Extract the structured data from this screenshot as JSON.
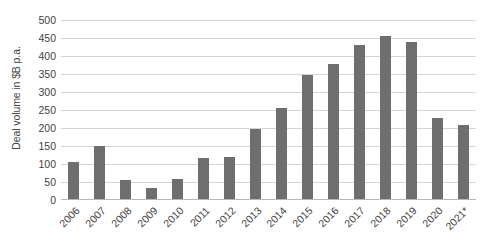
{
  "chart_data": {
    "type": "bar",
    "title": "",
    "subtitle": "",
    "xlabel": "",
    "ylabel": "Deal volume in $B p.a.",
    "ylim": [
      0,
      500
    ],
    "ytick_step": 50,
    "yticks": [
      500,
      450,
      400,
      350,
      300,
      250,
      200,
      150,
      100,
      50,
      0
    ],
    "grid": true,
    "legend": false,
    "legend_position": "none",
    "bar_color": "#6e6e6e",
    "gridline_color": "#d4d4d4",
    "axis_color": "#b8b8b8",
    "categories": [
      "2006",
      "2007",
      "2008",
      "2009",
      "2010",
      "2011",
      "2012",
      "2013",
      "2014",
      "2015",
      "2016",
      "2017",
      "2018",
      "2019",
      "2020",
      "2021*"
    ],
    "values": [
      105,
      150,
      55,
      33,
      58,
      118,
      120,
      197,
      255,
      347,
      378,
      430,
      456,
      440,
      228,
      207
    ],
    "annotations": [
      "2021 value marked with asterisk (*) indicating estimate or partial year"
    ]
  }
}
